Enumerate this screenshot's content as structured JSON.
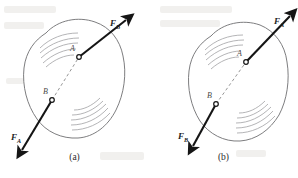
{
  "figure": {
    "type": "mechanics-diagram",
    "background_color": "#ffffff",
    "outline_color": "#6e6e70",
    "arrow_color": "#151515",
    "dashed_line_color": "#8b8b8b"
  },
  "panels": [
    {
      "id": "a",
      "caption": "(a)",
      "points": [
        {
          "label": "A",
          "x": 79,
          "y": 57
        },
        {
          "label": "B",
          "x": 52,
          "y": 100
        }
      ],
      "forces": [
        {
          "label": "F",
          "subscript": "B",
          "at_point": "A",
          "direction": "up-right",
          "label_x": 110,
          "label_y": 18
        },
        {
          "label": "F",
          "subscript": "A",
          "at_point": "B",
          "direction": "down-left",
          "label_x": 11,
          "label_y": 132
        }
      ]
    },
    {
      "id": "b",
      "caption": "(b)",
      "points": [
        {
          "label": "A",
          "x": 246,
          "y": 62
        },
        {
          "label": "B",
          "x": 216,
          "y": 104
        }
      ],
      "forces": [
        {
          "label": "F",
          "subscript": "A",
          "at_point": "A",
          "direction": "up-right",
          "label_x": 274,
          "label_y": 16
        },
        {
          "label": "F",
          "subscript": "B",
          "at_point": "B",
          "direction": "down-left",
          "label_x": 178,
          "label_y": 131
        }
      ]
    }
  ]
}
